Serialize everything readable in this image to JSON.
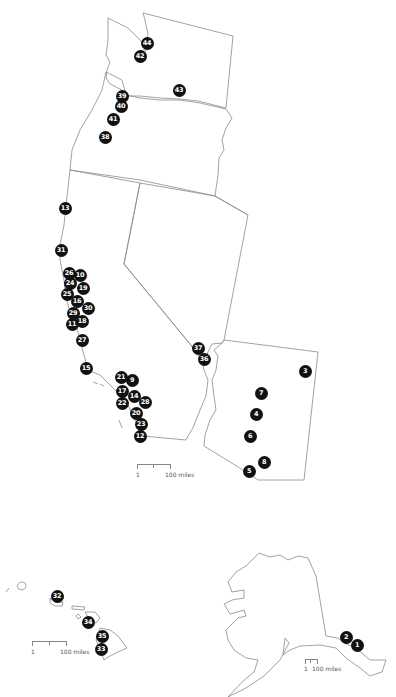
{
  "map": {
    "marker_color": "#111111",
    "outline_color": "#8a8a8a",
    "markers": [
      {
        "label": "44",
        "x": 147,
        "y": 43
      },
      {
        "label": "42",
        "x": 140,
        "y": 56
      },
      {
        "label": "43",
        "x": 179,
        "y": 90
      },
      {
        "label": "39",
        "x": 122,
        "y": 96
      },
      {
        "label": "40",
        "x": 121,
        "y": 106
      },
      {
        "label": "41",
        "x": 113,
        "y": 119
      },
      {
        "label": "38",
        "x": 105,
        "y": 137
      },
      {
        "label": "13",
        "x": 65,
        "y": 208
      },
      {
        "label": "31",
        "x": 61,
        "y": 250
      },
      {
        "label": "26",
        "x": 69,
        "y": 273
      },
      {
        "label": "10",
        "x": 80,
        "y": 275
      },
      {
        "label": "24",
        "x": 70,
        "y": 283
      },
      {
        "label": "19",
        "x": 83,
        "y": 288
      },
      {
        "label": "25",
        "x": 67,
        "y": 294
      },
      {
        "label": "16",
        "x": 77,
        "y": 301
      },
      {
        "label": "30",
        "x": 88,
        "y": 308
      },
      {
        "label": "29",
        "x": 73,
        "y": 313
      },
      {
        "label": "11",
        "x": 72,
        "y": 324
      },
      {
        "label": "18",
        "x": 82,
        "y": 321
      },
      {
        "label": "27",
        "x": 82,
        "y": 340
      },
      {
        "label": "15",
        "x": 86,
        "y": 368
      },
      {
        "label": "21",
        "x": 121,
        "y": 377
      },
      {
        "label": "9",
        "x": 132,
        "y": 380
      },
      {
        "label": "17",
        "x": 122,
        "y": 391
      },
      {
        "label": "14",
        "x": 134,
        "y": 396
      },
      {
        "label": "22",
        "x": 122,
        "y": 403
      },
      {
        "label": "28",
        "x": 145,
        "y": 402
      },
      {
        "label": "20",
        "x": 136,
        "y": 413
      },
      {
        "label": "23",
        "x": 141,
        "y": 424
      },
      {
        "label": "12",
        "x": 140,
        "y": 436
      },
      {
        "label": "37",
        "x": 198,
        "y": 348
      },
      {
        "label": "36",
        "x": 204,
        "y": 359
      },
      {
        "label": "3",
        "x": 305,
        "y": 371
      },
      {
        "label": "7",
        "x": 261,
        "y": 393
      },
      {
        "label": "4",
        "x": 256,
        "y": 414
      },
      {
        "label": "6",
        "x": 250,
        "y": 436
      },
      {
        "label": "8",
        "x": 264,
        "y": 462
      },
      {
        "label": "5",
        "x": 249,
        "y": 471
      },
      {
        "label": "32",
        "x": 57,
        "y": 596
      },
      {
        "label": "34",
        "x": 88,
        "y": 622
      },
      {
        "label": "35",
        "x": 102,
        "y": 636
      },
      {
        "label": "33",
        "x": 101,
        "y": 649
      },
      {
        "label": "2",
        "x": 346,
        "y": 637
      },
      {
        "label": "1",
        "x": 357,
        "y": 645
      }
    ]
  },
  "scales": {
    "mainland": {
      "start": "1",
      "end": "100 miles"
    },
    "hawaii": {
      "start": "1",
      "end": "100 miles"
    },
    "alaska": {
      "start": "1",
      "end": "100 miles"
    }
  }
}
